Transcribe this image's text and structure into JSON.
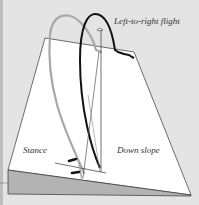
{
  "diagram": {
    "title": "Left-to-right flight",
    "labels": {
      "stance": "Stance",
      "down_slope": "Down slope"
    },
    "elements": [
      {
        "name": "swing-plane",
        "type": "trapezoid",
        "fill": "#ffffff"
      },
      {
        "name": "slope-wedge",
        "type": "triangle",
        "fill": "#b3b3b3"
      },
      {
        "name": "backswing-arc",
        "type": "path",
        "stroke": "#a8a8a8"
      },
      {
        "name": "downswing-arc",
        "type": "path",
        "stroke": "#111111"
      },
      {
        "name": "target-flag",
        "type": "icon"
      },
      {
        "name": "feet-markers",
        "type": "marks",
        "count": 2
      },
      {
        "name": "ball-line",
        "type": "line"
      }
    ],
    "colors": {
      "background": "#e4e4e4",
      "plane": "#ffffff",
      "slope": "#b3b3b3",
      "backswing": "#a8a8a8",
      "downswing": "#111111",
      "outline": "#333333"
    }
  }
}
